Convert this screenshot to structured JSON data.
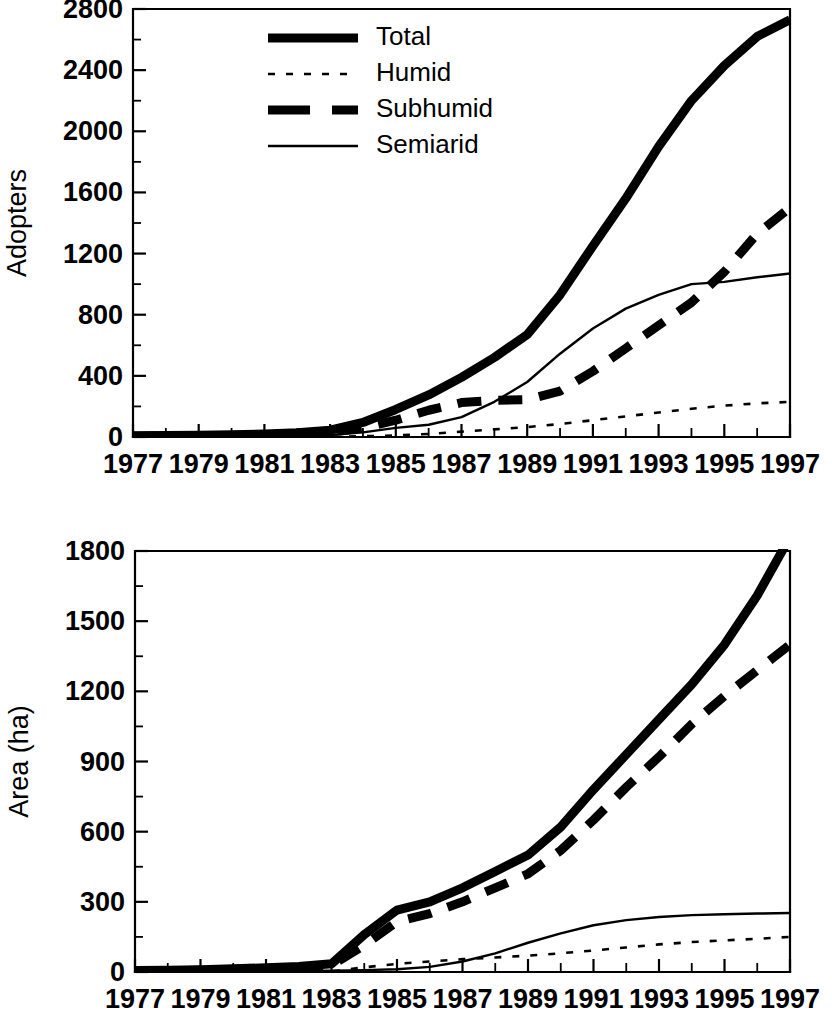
{
  "figure": {
    "background": "#ffffff",
    "ink_color": "#000000"
  },
  "legend": {
    "position": "top-left-inside-upper-panel",
    "entries": [
      {
        "key": "total",
        "label": "Total",
        "style": "thick-solid"
      },
      {
        "key": "humid",
        "label": "Humid",
        "style": "fine-dotted"
      },
      {
        "key": "subhumid",
        "label": "Subhumid",
        "style": "thick-dashed"
      },
      {
        "key": "semiarid",
        "label": "Semiarid",
        "style": "thin-solid"
      }
    ]
  },
  "chart_data": [
    {
      "id": "adopters",
      "type": "line",
      "title": "",
      "xlabel": "",
      "ylabel": "Adopters",
      "grid": false,
      "legend_position": "upper left (inside axes)",
      "x": [
        1977,
        1978,
        1979,
        1980,
        1981,
        1982,
        1983,
        1984,
        1985,
        1986,
        1987,
        1988,
        1989,
        1990,
        1991,
        1992,
        1993,
        1994,
        1995,
        1996,
        1997
      ],
      "xlim": [
        1977,
        1997
      ],
      "ylim": [
        0,
        2800
      ],
      "ytick_step": 400,
      "yminor_step": 200,
      "xtick_step": 1,
      "xtick_labels": [
        "1977",
        "1979",
        "1981",
        "1983",
        "1985",
        "1987",
        "1989",
        "1991",
        "1993",
        "1995",
        "1997"
      ],
      "xtick_label_values": [
        1977,
        1979,
        1981,
        1983,
        1985,
        1987,
        1989,
        1991,
        1993,
        1995,
        1997
      ],
      "ytick_labels": [
        "0",
        "400",
        "800",
        "1200",
        "1600",
        "2000",
        "2400",
        "2800"
      ],
      "series": [
        {
          "name": "Total",
          "key": "total",
          "style": "thick-solid",
          "values": [
            8,
            10,
            12,
            15,
            20,
            28,
            45,
            95,
            180,
            275,
            390,
            520,
            670,
            930,
            1250,
            1560,
            1900,
            2200,
            2430,
            2620,
            2730
          ]
        },
        {
          "name": "Humid",
          "key": "humid",
          "style": "fine-dotted",
          "values": [
            0,
            0,
            0,
            0,
            0,
            0,
            2,
            5,
            10,
            20,
            35,
            50,
            65,
            85,
            110,
            135,
            160,
            185,
            205,
            220,
            230
          ]
        },
        {
          "name": "Subhumid",
          "key": "subhumid",
          "style": "thick-dashed",
          "values": [
            5,
            6,
            8,
            10,
            13,
            18,
            30,
            60,
            110,
            175,
            225,
            240,
            245,
            300,
            430,
            580,
            730,
            880,
            1080,
            1330,
            1500
          ]
        },
        {
          "name": "Semiarid",
          "key": "semiarid",
          "style": "thin-solid",
          "values": [
            3,
            4,
            4,
            5,
            7,
            10,
            13,
            30,
            60,
            80,
            130,
            230,
            360,
            545,
            710,
            840,
            930,
            1000,
            1015,
            1045,
            1070
          ]
        }
      ]
    },
    {
      "id": "area",
      "type": "line",
      "title": "",
      "xlabel": "",
      "ylabel": "Area (ha)",
      "grid": false,
      "legend_position": "none",
      "x": [
        1977,
        1978,
        1979,
        1980,
        1981,
        1982,
        1983,
        1984,
        1985,
        1986,
        1987,
        1988,
        1989,
        1990,
        1991,
        1992,
        1993,
        1994,
        1995,
        1996,
        1997
      ],
      "xlim": [
        1977,
        1997
      ],
      "ylim": [
        0,
        1800
      ],
      "ytick_step": 300,
      "yminor_step": 150,
      "xtick_step": 1,
      "xtick_labels": [
        "1977",
        "1979",
        "1981",
        "1983",
        "1985",
        "1987",
        "1989",
        "1991",
        "1993",
        "1995",
        "1997"
      ],
      "xtick_label_values": [
        1977,
        1979,
        1981,
        1983,
        1985,
        1987,
        1989,
        1991,
        1993,
        1995,
        1997
      ],
      "ytick_labels": [
        "0",
        "300",
        "600",
        "900",
        "1200",
        "1500",
        "1800"
      ],
      "series": [
        {
          "name": "Total",
          "key": "total",
          "style": "thick-solid",
          "values": [
            6,
            8,
            10,
            14,
            18,
            24,
            35,
            160,
            265,
            300,
            360,
            430,
            500,
            620,
            780,
            930,
            1080,
            1230,
            1400,
            1610,
            1860
          ]
        },
        {
          "name": "Humid",
          "key": "humid",
          "style": "fine-dotted",
          "values": [
            0,
            0,
            0,
            0,
            0,
            0,
            2,
            20,
            35,
            45,
            55,
            62,
            70,
            80,
            92,
            105,
            118,
            128,
            135,
            142,
            150
          ]
        },
        {
          "name": "Subhumid",
          "key": "subhumid",
          "style": "thick-dashed",
          "values": [
            4,
            5,
            7,
            10,
            13,
            18,
            28,
            115,
            215,
            250,
            300,
            360,
            420,
            520,
            650,
            790,
            920,
            1060,
            1180,
            1290,
            1400
          ]
        },
        {
          "name": "Semiarid",
          "key": "semiarid",
          "style": "thin-solid",
          "values": [
            2,
            2,
            3,
            3,
            4,
            5,
            6,
            8,
            12,
            22,
            45,
            80,
            125,
            165,
            200,
            222,
            235,
            243,
            247,
            250,
            252
          ]
        }
      ]
    }
  ]
}
